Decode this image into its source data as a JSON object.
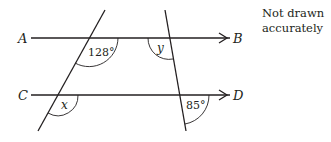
{
  "diagram": {
    "type": "parallel-lines-angles",
    "lines": {
      "ab": {
        "start_label": "A",
        "end_label": "B"
      },
      "cd": {
        "start_label": "C",
        "end_label": "D"
      }
    },
    "angles": {
      "top_left": "128°",
      "top_right": "y",
      "bottom_left": "x",
      "bottom_right": "85°"
    },
    "note": {
      "line1": "Not drawn",
      "line2": "accurately"
    },
    "colors": {
      "stroke": "#231f20",
      "background": "#ffffff"
    }
  }
}
